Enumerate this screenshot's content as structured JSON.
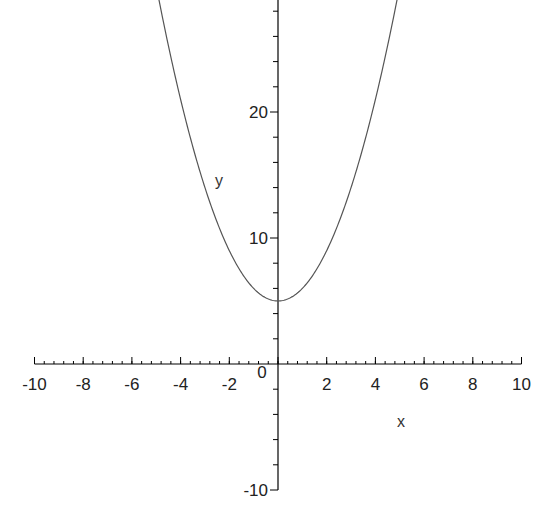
{
  "chart_data": {
    "type": "line",
    "title": "",
    "xlabel": "x",
    "ylabel": "y",
    "xlim": [
      -10,
      10
    ],
    "ylim": [
      -10,
      29
    ],
    "grid": false,
    "legend": null,
    "function": "y = x^2 + 5",
    "series": [
      {
        "name": "x^2 + 5",
        "x": [
          -4.9,
          -4,
          -3,
          -2,
          -1,
          0,
          1,
          2,
          3,
          4,
          4.9
        ],
        "values": [
          29,
          21,
          14,
          9,
          6,
          5,
          6,
          9,
          14,
          21,
          29
        ]
      }
    ],
    "x_ticks": [
      -10,
      -8,
      -6,
      -4,
      -2,
      0,
      2,
      4,
      6,
      8,
      10
    ],
    "x_tick_labels": [
      "-10",
      "-8",
      "-6",
      "-4",
      "-2",
      "0",
      "2",
      "4",
      "6",
      "8",
      "10"
    ],
    "y_ticks": [
      -10,
      10,
      20
    ],
    "y_tick_labels": [
      "-10",
      "10",
      "20"
    ],
    "line_color": "#555555",
    "axis_color": "#000000"
  }
}
